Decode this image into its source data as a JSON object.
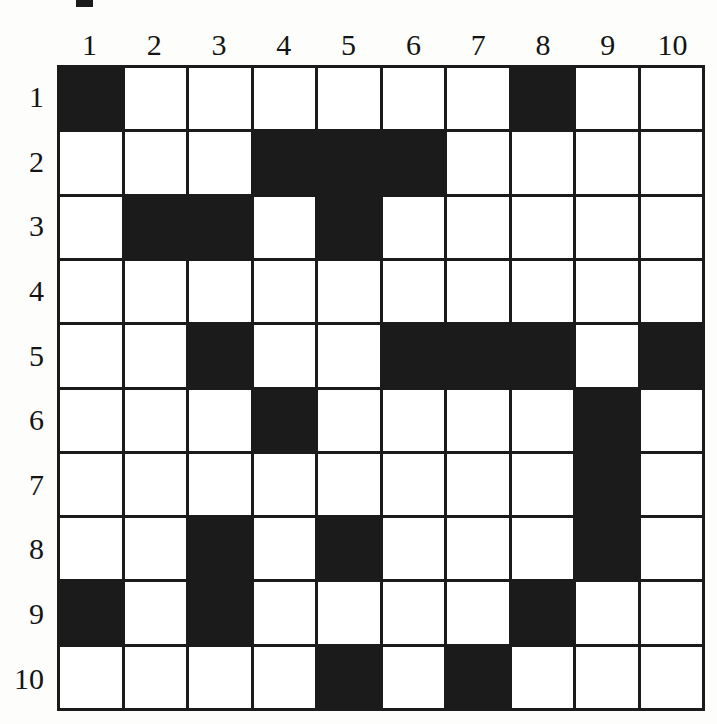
{
  "puzzle": {
    "type": "nonogram-grid",
    "size": 10,
    "column_headers": [
      "1",
      "2",
      "3",
      "4",
      "5",
      "6",
      "7",
      "8",
      "9",
      "10"
    ],
    "row_headers": [
      "1",
      "2",
      "3",
      "4",
      "5",
      "6",
      "7",
      "8",
      "9",
      "10"
    ],
    "colors": {
      "filled": "#1b1b1b",
      "empty": "#ffffff",
      "gridline": "#1b1b1b",
      "label": "#141414",
      "page_background": "#fdfdfc"
    },
    "filled_cells_by_row": {
      "1": [
        1,
        8
      ],
      "2": [
        4,
        5,
        6
      ],
      "3": [
        2,
        3,
        5
      ],
      "4": [],
      "5": [
        3,
        6,
        7,
        8,
        10
      ],
      "6": [
        4,
        9
      ],
      "7": [
        9
      ],
      "8": [
        3,
        5,
        9
      ],
      "9": [
        1,
        3,
        8
      ],
      "10": [
        5,
        7
      ]
    },
    "matrix": [
      [
        1,
        0,
        0,
        0,
        0,
        0,
        0,
        1,
        0,
        0
      ],
      [
        0,
        0,
        0,
        1,
        1,
        1,
        0,
        0,
        0,
        0
      ],
      [
        0,
        1,
        1,
        0,
        1,
        0,
        0,
        0,
        0,
        0
      ],
      [
        0,
        0,
        0,
        0,
        0,
        0,
        0,
        0,
        0,
        0
      ],
      [
        0,
        0,
        1,
        0,
        0,
        1,
        1,
        1,
        0,
        1
      ],
      [
        0,
        0,
        0,
        1,
        0,
        0,
        0,
        0,
        1,
        0
      ],
      [
        0,
        0,
        0,
        0,
        0,
        0,
        0,
        0,
        1,
        0
      ],
      [
        0,
        0,
        1,
        0,
        1,
        0,
        0,
        0,
        1,
        0
      ],
      [
        1,
        0,
        1,
        0,
        0,
        0,
        0,
        1,
        0,
        0
      ],
      [
        0,
        0,
        0,
        0,
        1,
        0,
        1,
        0,
        0,
        0
      ]
    ],
    "total_filled": 25
  }
}
